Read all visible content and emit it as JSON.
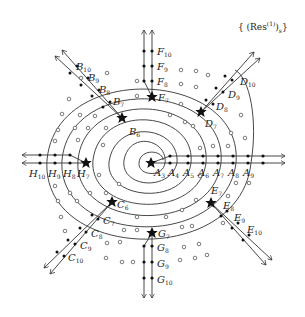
{
  "title": {
    "prefix": "{ (Res",
    "superscript": "(1)",
    "close": ")",
    "subscript": "s",
    "suffix": "}"
  },
  "center": {
    "x": 151,
    "y": 163
  },
  "strands": [
    {
      "id": "A",
      "direction": "east",
      "labels": [
        "A3",
        "A4",
        "A5",
        "A6",
        "A7",
        "A8",
        "A9"
      ]
    },
    {
      "id": "B",
      "direction": "north-west",
      "labels": [
        "B6",
        "B7",
        "B8",
        "B9",
        "B10"
      ]
    },
    {
      "id": "C",
      "direction": "south-west",
      "labels": [
        "C6",
        "C7",
        "C8",
        "C9",
        "C10"
      ]
    },
    {
      "id": "D",
      "direction": "north-east",
      "labels": [
        "D7",
        "D8",
        "D9",
        "D10"
      ]
    },
    {
      "id": "E",
      "direction": "south-east",
      "labels": [
        "E7",
        "E8",
        "E9",
        "E10"
      ]
    },
    {
      "id": "F",
      "direction": "north",
      "labels": [
        "F7",
        "F8",
        "F9",
        "F10"
      ]
    },
    {
      "id": "G",
      "direction": "south",
      "labels": [
        "G7",
        "G8",
        "G9",
        "G10"
      ]
    },
    {
      "id": "H",
      "direction": "west",
      "labels": [
        "H7",
        "H8",
        "H9",
        "H10"
      ]
    }
  ],
  "stars": [
    "A3",
    "B6",
    "C6",
    "D7",
    "E7",
    "F7",
    "G7",
    "H7"
  ],
  "colors": {
    "line": "#333333",
    "dot": "#111111",
    "background": "#ffffff"
  }
}
